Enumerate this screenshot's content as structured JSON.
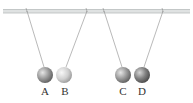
{
  "diagram": {
    "rod": {
      "y": 11,
      "x1": 3,
      "x2": 190,
      "color": "#c8cccc"
    },
    "balls": [
      {
        "label": "A",
        "cx": 45,
        "cy": 75,
        "r": 8,
        "anchor_x": 27,
        "shade": "medium"
      },
      {
        "label": "B",
        "cx": 64,
        "cy": 75,
        "r": 8,
        "anchor_x": 87,
        "shade": "light"
      },
      {
        "label": "C",
        "cx": 123,
        "cy": 75,
        "r": 8,
        "anchor_x": 104,
        "shade": "medium"
      },
      {
        "label": "D",
        "cx": 142,
        "cy": 75,
        "r": 8,
        "anchor_x": 163,
        "shade": "dark"
      }
    ],
    "labels": {
      "a": "A",
      "b": "B",
      "c": "C",
      "d": "D"
    }
  }
}
